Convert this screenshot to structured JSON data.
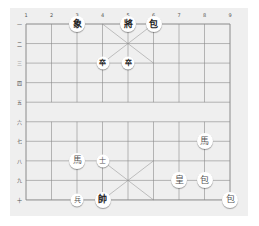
{
  "board": {
    "columns": [
      "1",
      "2",
      "3",
      "4",
      "5",
      "6",
      "7",
      "8",
      "9"
    ],
    "rows": [
      "一",
      "二",
      "三",
      "四",
      "五",
      "六",
      "七",
      "八",
      "九",
      "十"
    ],
    "colors": {
      "background": "#efefef",
      "line": "#8a8a8a",
      "piece": "#ffffff"
    }
  },
  "pieces": [
    {
      "char": "象",
      "col": 3,
      "row": 1,
      "side": "black"
    },
    {
      "char": "將",
      "col": 5,
      "row": 1,
      "side": "black"
    },
    {
      "char": "包",
      "col": 6,
      "row": 1,
      "side": "black"
    },
    {
      "char": "卒",
      "col": 4,
      "row": 3,
      "side": "black",
      "small": true
    },
    {
      "char": "卒",
      "col": 5,
      "row": 3,
      "side": "black",
      "small": true
    },
    {
      "char": "馬",
      "col": 8,
      "row": 7,
      "side": "red"
    },
    {
      "char": "馬",
      "col": 3,
      "row": 8,
      "side": "red"
    },
    {
      "char": "士",
      "col": 4,
      "row": 8,
      "side": "red",
      "small": true
    },
    {
      "char": "皇",
      "col": 7,
      "row": 9,
      "side": "red"
    },
    {
      "char": "包",
      "col": 8,
      "row": 9,
      "side": "red"
    },
    {
      "char": "兵",
      "col": 3,
      "row": 10,
      "side": "red",
      "small": true
    },
    {
      "char": "帥",
      "col": 4,
      "row": 10,
      "side": "black"
    },
    {
      "char": "包",
      "col": 9,
      "row": 10,
      "side": "red"
    }
  ]
}
